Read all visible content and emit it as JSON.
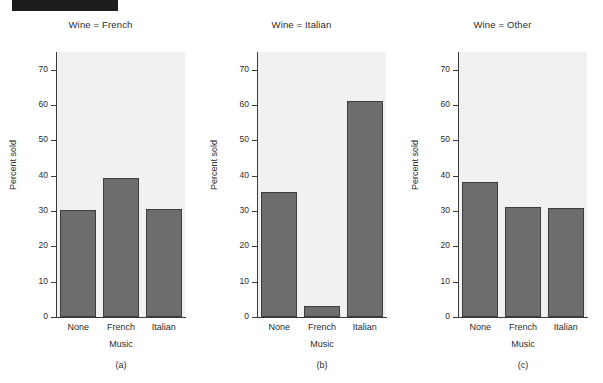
{
  "figure": {
    "redaction_bar": "black-bar",
    "background_color": "#ffffff",
    "bar_fill_color": "#6d6d6d",
    "bar_edge_color": "#3d3d3d",
    "panel_background_color": "#f1f1f1"
  },
  "chart_data": {
    "type": "bar",
    "title": "",
    "xlabel": "Music",
    "ylabel": "Percent sold",
    "ylim": [
      0,
      75
    ],
    "yticks": [
      0,
      10,
      20,
      30,
      40,
      50,
      60,
      70
    ],
    "ytick_labels": [
      "0",
      "10",
      "20",
      "30",
      "40",
      "50",
      "60",
      "70"
    ],
    "categories": [
      "None",
      "French",
      "Italian"
    ],
    "grid": false,
    "legend": "none",
    "panels": [
      {
        "title": "Wine = French",
        "caption": "(a)",
        "categories": [
          "None",
          "French",
          "Italian"
        ],
        "values": [
          30.4,
          39.4,
          30.6
        ]
      },
      {
        "title": "Wine = Italian",
        "caption": "(b)",
        "categories": [
          "None",
          "French",
          "Italian"
        ],
        "values": [
          35.5,
          3.2,
          61.0
        ]
      },
      {
        "title": "Wine = Other",
        "caption": "(c)",
        "categories": [
          "None",
          "French",
          "Italian"
        ],
        "values": [
          38.1,
          31.0,
          30.9
        ]
      }
    ]
  }
}
